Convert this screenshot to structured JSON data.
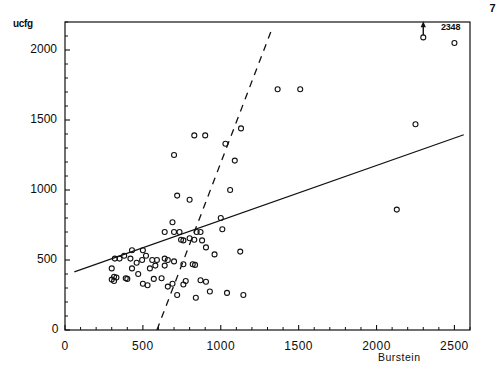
{
  "chart_data": {
    "type": "scatter",
    "title": "",
    "xlabel": "Burstein",
    "ylabel": "ucfg",
    "xlim": [
      0,
      2600
    ],
    "ylim": [
      0,
      2200
    ],
    "xticks": [
      0,
      500,
      1000,
      1500,
      2000,
      2500
    ],
    "yticks": [
      0,
      500,
      1000,
      1500,
      2000
    ],
    "xtick_labels": [
      "0",
      "500",
      "1000",
      "1500",
      "2000",
      "2500"
    ],
    "ytick_labels": [
      "0",
      "500",
      "1000",
      "1500",
      "2000"
    ],
    "xminor_step": 100,
    "yminor_step": 100,
    "grid": false,
    "legend": null,
    "frame": "box",
    "corner_label": "7",
    "annotations": [
      {
        "text": "2348",
        "x": 2300,
        "y": 2120,
        "arrow": "up",
        "note": "off-scale point value indicator"
      }
    ],
    "points": [
      {
        "x": 2300,
        "y": 2090
      },
      {
        "x": 2500,
        "y": 2050
      },
      {
        "x": 1365,
        "y": 1720
      },
      {
        "x": 1510,
        "y": 1720
      },
      {
        "x": 2250,
        "y": 1470
      },
      {
        "x": 830,
        "y": 1390
      },
      {
        "x": 900,
        "y": 1390
      },
      {
        "x": 1130,
        "y": 1440
      },
      {
        "x": 1030,
        "y": 1330
      },
      {
        "x": 700,
        "y": 1250
      },
      {
        "x": 1090,
        "y": 1210
      },
      {
        "x": 1060,
        "y": 1000
      },
      {
        "x": 720,
        "y": 960
      },
      {
        "x": 800,
        "y": 930
      },
      {
        "x": 2130,
        "y": 860
      },
      {
        "x": 1000,
        "y": 800
      },
      {
        "x": 1010,
        "y": 720
      },
      {
        "x": 1125,
        "y": 560
      },
      {
        "x": 960,
        "y": 540
      },
      {
        "x": 905,
        "y": 590
      },
      {
        "x": 880,
        "y": 640
      },
      {
        "x": 870,
        "y": 700
      },
      {
        "x": 845,
        "y": 700
      },
      {
        "x": 830,
        "y": 645
      },
      {
        "x": 800,
        "y": 655
      },
      {
        "x": 760,
        "y": 640
      },
      {
        "x": 745,
        "y": 645
      },
      {
        "x": 735,
        "y": 700
      },
      {
        "x": 700,
        "y": 700
      },
      {
        "x": 690,
        "y": 770
      },
      {
        "x": 640,
        "y": 700
      },
      {
        "x": 640,
        "y": 510
      },
      {
        "x": 660,
        "y": 500
      },
      {
        "x": 700,
        "y": 490
      },
      {
        "x": 760,
        "y": 470
      },
      {
        "x": 820,
        "y": 470
      },
      {
        "x": 835,
        "y": 465
      },
      {
        "x": 590,
        "y": 500
      },
      {
        "x": 560,
        "y": 500
      },
      {
        "x": 520,
        "y": 530
      },
      {
        "x": 500,
        "y": 570
      },
      {
        "x": 495,
        "y": 500
      },
      {
        "x": 460,
        "y": 480
      },
      {
        "x": 430,
        "y": 570
      },
      {
        "x": 420,
        "y": 510
      },
      {
        "x": 380,
        "y": 530
      },
      {
        "x": 350,
        "y": 510
      },
      {
        "x": 320,
        "y": 510
      },
      {
        "x": 300,
        "y": 440
      },
      {
        "x": 315,
        "y": 380
      },
      {
        "x": 330,
        "y": 375
      },
      {
        "x": 300,
        "y": 360
      },
      {
        "x": 315,
        "y": 350
      },
      {
        "x": 390,
        "y": 370
      },
      {
        "x": 400,
        "y": 365
      },
      {
        "x": 430,
        "y": 440
      },
      {
        "x": 470,
        "y": 400
      },
      {
        "x": 500,
        "y": 330
      },
      {
        "x": 530,
        "y": 320
      },
      {
        "x": 545,
        "y": 440
      },
      {
        "x": 570,
        "y": 365
      },
      {
        "x": 620,
        "y": 370
      },
      {
        "x": 660,
        "y": 310
      },
      {
        "x": 690,
        "y": 330
      },
      {
        "x": 760,
        "y": 325
      },
      {
        "x": 775,
        "y": 350
      },
      {
        "x": 720,
        "y": 250
      },
      {
        "x": 840,
        "y": 230
      },
      {
        "x": 870,
        "y": 355
      },
      {
        "x": 905,
        "y": 345
      },
      {
        "x": 930,
        "y": 275
      },
      {
        "x": 1040,
        "y": 265
      },
      {
        "x": 1145,
        "y": 250
      },
      {
        "x": 640,
        "y": 460
      },
      {
        "x": 580,
        "y": 460
      }
    ],
    "lines": [
      {
        "name": "regression-solid",
        "style": "solid",
        "x0": 60,
        "y0": 415,
        "x1": 2560,
        "y1": 1395
      },
      {
        "name": "regression-dashed",
        "style": "dashed",
        "x0": 590,
        "y0": 0,
        "x1": 1330,
        "y1": 2155
      }
    ]
  },
  "labels": {
    "ylabel": "ucfg",
    "xlabel": "Burstein",
    "corner": "7",
    "annotation": "2348"
  }
}
